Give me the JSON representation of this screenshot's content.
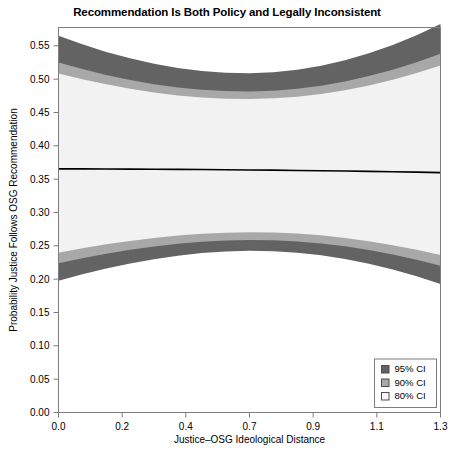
{
  "chart_data": {
    "type": "area",
    "title": "Recommendation Is Both Policy and Legally Inconsistent",
    "xlabel": "Justice–OSG Ideological Distance",
    "ylabel": "Probability Justice Follows OSG Recommendation",
    "xlim": [
      0.0,
      1.3
    ],
    "ylim": [
      0.0,
      0.5775
    ],
    "grid": false,
    "xticks": [
      0.0,
      0.2,
      0.4,
      0.7,
      0.9,
      1.1,
      1.3
    ],
    "xtick_labels": [
      "0.0",
      "0.2",
      "0.4",
      "0.7",
      "0.9",
      "1.1",
      "1.3"
    ],
    "xtick_values": [
      0.0,
      0.2167,
      0.4333,
      0.65,
      0.8667,
      1.0833,
      1.3
    ],
    "yticks": [
      0.0,
      0.05,
      0.1,
      0.15,
      0.2,
      0.25,
      0.3,
      0.35,
      0.4,
      0.45,
      0.5,
      0.55
    ],
    "ytick_labels": [
      "0.00",
      "0.05",
      "0.10",
      "0.15",
      "0.20",
      "0.25",
      "0.30",
      "0.35",
      "0.40",
      "0.45",
      "0.50",
      "0.55"
    ],
    "x": [
      0.0,
      0.0813,
      0.1625,
      0.2438,
      0.325,
      0.4063,
      0.4875,
      0.5688,
      0.65,
      0.7313,
      0.8125,
      0.8938,
      0.975,
      1.0563,
      1.1375,
      1.2188,
      1.3
    ],
    "series": [
      {
        "name": "estimate",
        "role": "point-estimate",
        "color": "#000000",
        "values": [
          0.3655,
          0.3654,
          0.3653,
          0.3651,
          0.3649,
          0.3647,
          0.3644,
          0.3641,
          0.3638,
          0.3635,
          0.3631,
          0.3627,
          0.3622,
          0.3617,
          0.3611,
          0.3605,
          0.3598
        ]
      },
      {
        "name": "80% CI",
        "role": "band",
        "color": "#f2f2f2",
        "upper": [
          0.5085,
          0.4999,
          0.4922,
          0.4856,
          0.48,
          0.4756,
          0.4724,
          0.4706,
          0.4702,
          0.4712,
          0.4738,
          0.4779,
          0.4835,
          0.4906,
          0.4991,
          0.5091,
          0.5204
        ],
        "lower": [
          0.2397,
          0.2463,
          0.2522,
          0.2574,
          0.2618,
          0.2654,
          0.2681,
          0.2698,
          0.2704,
          0.27,
          0.2684,
          0.2657,
          0.2619,
          0.257,
          0.251,
          0.244,
          0.2361
        ]
      },
      {
        "name": "90% CI",
        "role": "band",
        "color": "#a8a8a8",
        "upper": [
          0.525,
          0.5151,
          0.5063,
          0.4988,
          0.4925,
          0.4876,
          0.4841,
          0.4821,
          0.4816,
          0.4828,
          0.4857,
          0.4903,
          0.4966,
          0.5046,
          0.5142,
          0.5255,
          0.5383
        ],
        "lower": [
          0.2237,
          0.2313,
          0.2381,
          0.244,
          0.249,
          0.2531,
          0.2562,
          0.2581,
          0.2589,
          0.2584,
          0.2566,
          0.2535,
          0.2492,
          0.2437,
          0.2369,
          0.229,
          0.2201
        ]
      },
      {
        "name": "95% CI",
        "role": "band",
        "color": "#636363",
        "upper": [
          0.565,
          0.5523,
          0.5409,
          0.5312,
          0.5231,
          0.5167,
          0.5122,
          0.5096,
          0.509,
          0.5105,
          0.5142,
          0.5202,
          0.5284,
          0.5388,
          0.5513,
          0.566,
          0.5826
        ],
        "lower": [
          0.1976,
          0.2072,
          0.2159,
          0.2235,
          0.2299,
          0.2351,
          0.2391,
          0.2416,
          0.2426,
          0.2419,
          0.2396,
          0.2357,
          0.2302,
          0.2231,
          0.2145,
          0.2044,
          0.1929
        ]
      }
    ],
    "legend": {
      "position": "bottom-right",
      "entries": [
        {
          "label": "95% CI",
          "color": "#636363"
        },
        {
          "label": "90% CI",
          "color": "#a8a8a8"
        },
        {
          "label": "80% CI",
          "color": "#f7f7f7"
        }
      ]
    }
  }
}
